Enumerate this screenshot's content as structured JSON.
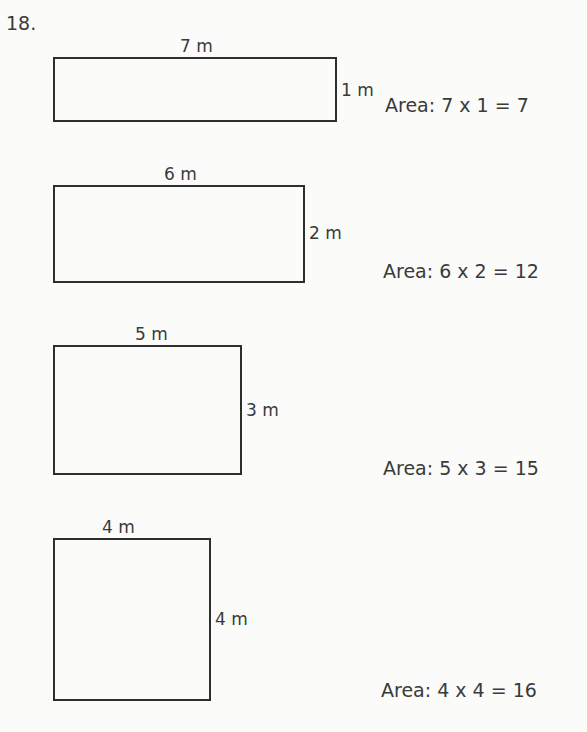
{
  "problem": {
    "number": "18.",
    "shapes": [
      {
        "width_label": "7 m",
        "height_label": "1 m",
        "area_text": "Area: 7 x 1 = 7",
        "box": {
          "left": 53,
          "top": 57,
          "width": 284,
          "height": 65
        }
      },
      {
        "width_label": "6 m",
        "height_label": "2 m",
        "area_text": "Area: 6 x 2 = 12",
        "box": {
          "left": 53,
          "top": 185,
          "width": 252,
          "height": 98
        }
      },
      {
        "width_label": "5 m",
        "height_label": "3 m",
        "area_text": "Area: 5 x 3 = 15",
        "box": {
          "left": 53,
          "top": 345,
          "width": 189,
          "height": 130
        }
      },
      {
        "width_label": "4 m",
        "height_label": "4 m",
        "area_text": "Area: 4 x 4 = 16",
        "box": {
          "left": 53,
          "top": 538,
          "width": 158,
          "height": 163
        }
      }
    ]
  }
}
